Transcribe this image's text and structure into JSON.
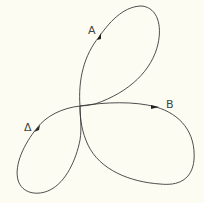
{
  "diagram": {
    "type": "three-lobed closed curve (trefoil) with directional markers",
    "labels": {
      "a": "A",
      "b": "B",
      "delta": "Δ"
    },
    "colors": {
      "background": "#fdfcf3",
      "curve": "#3a3a3a",
      "label": "#444444"
    }
  }
}
